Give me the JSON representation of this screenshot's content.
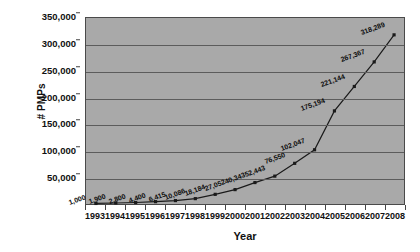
{
  "chart_data": {
    "type": "line",
    "title": "",
    "xlabel": "Year",
    "ylabel": "# PMPs",
    "categories": [
      "1993",
      "1994",
      "1995",
      "1996",
      "1997",
      "1998",
      "1999",
      "2000",
      "2001",
      "2002",
      "2003",
      "2004",
      "2005",
      "2006",
      "2007",
      "2008"
    ],
    "values": [
      1000,
      1900,
      2800,
      4400,
      6415,
      10086,
      18184,
      27052,
      40343,
      52443,
      76550,
      102047,
      175194,
      221144,
      267367,
      318289
    ],
    "data_labels": [
      "1,000",
      "1,900",
      "2,800",
      "4,400",
      "6,415",
      "10,086",
      "18,184",
      "27,052",
      "40,343",
      "52,443",
      "76,550",
      "102,047",
      "175,194",
      "221,144",
      "267,367",
      "318,289"
    ],
    "ylim": [
      0,
      350000
    ],
    "ytick_labels": [
      "50,000",
      "100,000",
      "150,000",
      "200,000",
      "250,000",
      "300,000",
      "350,000"
    ],
    "ytick_values": [
      50000,
      100000,
      150000,
      200000,
      250000,
      300000,
      350000
    ],
    "grid": true,
    "legend": false,
    "series_color": "#1a1a1a",
    "plot_background": "#a9a9a9",
    "gridline_color": "#5c5c5c",
    "marker": "square"
  }
}
